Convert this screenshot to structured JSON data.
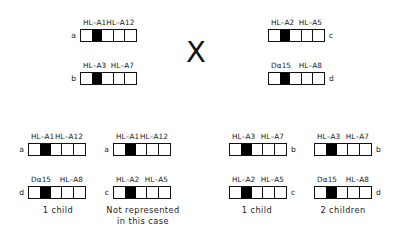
{
  "figure": {
    "cross_symbol": "X",
    "bar_pattern": [
      "white",
      "black",
      "white",
      "white",
      "white"
    ]
  },
  "parents": [
    {
      "id": "parent-haplotype-a",
      "letter": "a",
      "letter_side": "left",
      "locus_left": "HL–A1",
      "locus_right": "HL–A12"
    },
    {
      "id": "parent-haplotype-b",
      "letter": "b",
      "letter_side": "left",
      "locus_left": "HL–A3",
      "locus_right": "HL–A7"
    },
    {
      "id": "parent-haplotype-c",
      "letter": "c",
      "letter_side": "right",
      "locus_left": "HL–A2",
      "locus_right": "HL–A5"
    },
    {
      "id": "parent-haplotype-d",
      "letter": "d",
      "letter_side": "right",
      "locus_left": "Dα15",
      "locus_right": "HL–A8"
    }
  ],
  "offspring": [
    {
      "id": "offspring-ad",
      "caption": "1 child",
      "haplotypes": [
        {
          "letter": "a",
          "letter_side": "left",
          "locus_left": "HL–A1",
          "locus_right": "HL–A12"
        },
        {
          "letter": "d",
          "letter_side": "left",
          "locus_left": "Dα15",
          "locus_right": "HL–A8"
        }
      ]
    },
    {
      "id": "offspring-ac",
      "caption": "Not represented\nin this case",
      "haplotypes": [
        {
          "letter": "a",
          "letter_side": "left",
          "locus_left": "HL–A1",
          "locus_right": "HL–A12"
        },
        {
          "letter": "c",
          "letter_side": "left",
          "locus_left": "HL–A2",
          "locus_right": "HL–A5"
        }
      ]
    },
    {
      "id": "offspring-bc",
      "caption": "1 child",
      "haplotypes": [
        {
          "letter": "b",
          "letter_side": "right",
          "locus_left": "HL–A3",
          "locus_right": "HL–A7"
        },
        {
          "letter": "c",
          "letter_side": "right",
          "locus_left": "HL–A2",
          "locus_right": "HL–A5"
        }
      ]
    },
    {
      "id": "offspring-bd",
      "caption": "2 children",
      "haplotypes": [
        {
          "letter": "b",
          "letter_side": "right",
          "locus_left": "HL–A3",
          "locus_right": "HL–A7"
        },
        {
          "letter": "d",
          "letter_side": "right",
          "locus_left": "Dα15",
          "locus_right": "HL–A8"
        }
      ]
    }
  ]
}
